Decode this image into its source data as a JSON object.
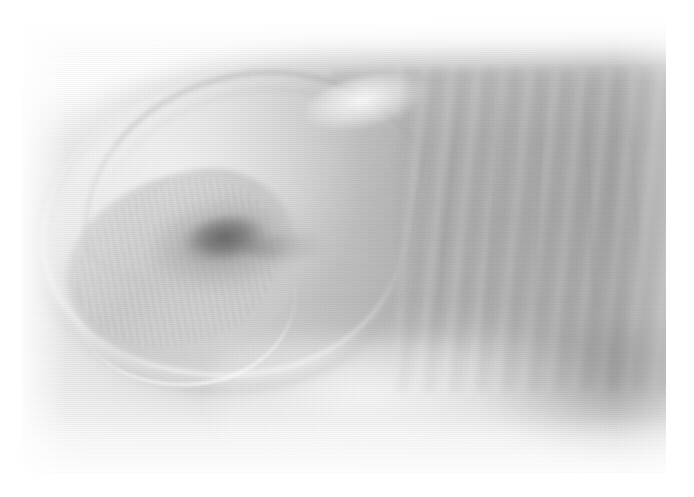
{
  "image": {
    "kind": "clinical-photograph",
    "modality": "Color photograph (greyscale reproduction)",
    "subject": "Fingertip and nail plate",
    "orientation": "Finger extending from right edge, distal tip at left",
    "caption": "",
    "canvas": {
      "width_px": 694,
      "height_px": 497
    },
    "print_area": {
      "left_px": 22,
      "top_px": 22,
      "width_px": 644,
      "height_px": 451
    }
  },
  "palette": {
    "page_background": "#ffffff",
    "print_border": "#ffffff",
    "highlight_white": "#fdfdfd",
    "skin_light": "#e6e6e6",
    "skin_mid": "#b8b8b8",
    "skin_shadow": "#9e9e9e",
    "nail_plate": "#f0f0f0",
    "nail_edge_line": "#8a8a8a",
    "lesion_dark": "#787878",
    "lesion_core": "#606060"
  },
  "regions": [
    {
      "id": "nail-plate",
      "label": "Nail plate",
      "note": "Large oval occupying the left half of the frame"
    },
    {
      "id": "proximal-nail-fold",
      "label": "Proximal nail fold / cuticle",
      "note": "Dark arc across the upper margin of the nail"
    },
    {
      "id": "lateral-nail-fold",
      "label": "Lateral nail fold",
      "note": "Bright rim along the lower-left border of the nail"
    },
    {
      "id": "dystrophic-crescent",
      "label": "Dystrophic / onycholytic crescent",
      "note": "Roughened crescent in the lower-left quadrant of the nail with fine ridging"
    },
    {
      "id": "subungual-lesion",
      "label": "Pigmented subungual lesion",
      "note": "Irregular dark macule near the centre of the nail with a distal streak"
    },
    {
      "id": "distal-skin",
      "label": "Distal digital skin",
      "note": "Right portion of the frame showing transverse skin creases"
    }
  ],
  "annotations": {
    "finding_label": "Pigmented subungual lesion",
    "finding_visible": false
  }
}
